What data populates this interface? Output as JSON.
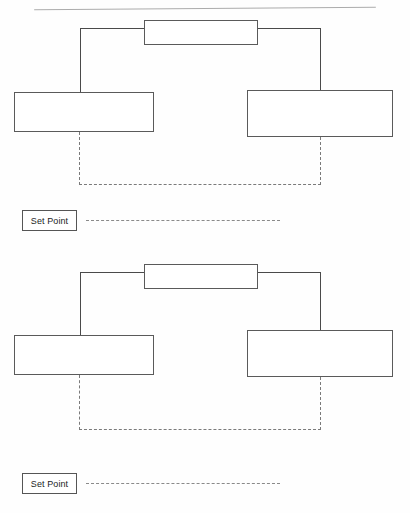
{
  "page": {
    "background_color": "#fefefe",
    "line_color": "#4a4a4a",
    "dashed_color": "#7a7a7a",
    "width": 410,
    "height": 513
  },
  "scan_rule": {
    "name": "top-scan-line",
    "description": "slanted horizontal scan artifact line near top of page"
  },
  "diagrams": [
    {
      "id": "diagram-1",
      "blocks": {
        "top": {
          "label": "",
          "x": 144,
          "y": 20,
          "w": 114,
          "h": 25
        },
        "left": {
          "label": "",
          "x": 14,
          "y": 92,
          "w": 140,
          "h": 40
        },
        "right": {
          "label": "",
          "x": 247,
          "y": 90,
          "w": 146,
          "h": 47
        }
      },
      "feedback": {
        "label": "",
        "left_x": 79,
        "right_x": 320,
        "y": 184
      },
      "setpoint": {
        "label": "Set Point",
        "dash_length": 194
      }
    },
    {
      "id": "diagram-2",
      "blocks": {
        "top": {
          "label": "",
          "x": 144,
          "y": 264,
          "w": 114,
          "h": 25
        },
        "left": {
          "label": "",
          "x": 14,
          "y": 335,
          "w": 140,
          "h": 40
        },
        "right": {
          "label": "",
          "x": 247,
          "y": 330,
          "w": 146,
          "h": 47
        }
      },
      "feedback": {
        "label": "",
        "left_x": 79,
        "right_x": 320,
        "y": 429
      },
      "setpoint": {
        "label": "Set Point",
        "dash_length": 194
      }
    }
  ]
}
